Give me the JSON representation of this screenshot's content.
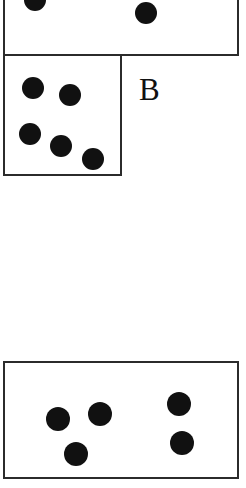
{
  "figure": {
    "kind": "dice-faces-diagram",
    "background_color": "#ffffff",
    "ink_color": "#111111",
    "border_color": "#2b2b2b",
    "labels": [
      {
        "name": "label-b",
        "text": "B",
        "x": 139,
        "y": 74,
        "font_size": 31
      }
    ],
    "groups": [
      {
        "name": "upper-pair-row",
        "x": 3,
        "y": 0,
        "width": 236,
        "height": 56,
        "cells": [
          {
            "name": "cell-upper-left",
            "pip_count": 1,
            "cropped_top": true,
            "x": 0,
            "y": 0,
            "width": 119,
            "height": 56,
            "pips": [
              {
                "cx": 30,
                "cy": 0,
                "r": 11,
                "clipped": true
              }
            ]
          },
          {
            "name": "cell-upper-right",
            "pip_count": 1,
            "cropped_top": true,
            "x": 117,
            "y": 0,
            "width": 119,
            "height": 56,
            "pips": [
              {
                "cx": 26,
                "cy": 13,
                "r": 11,
                "clipped": false
              }
            ]
          }
        ]
      },
      {
        "name": "five-face-row",
        "x": 3,
        "y": 54,
        "width": 119,
        "height": 122,
        "cells": [
          {
            "name": "cell-five",
            "pip_count": 5,
            "cropped_top": false,
            "x": 0,
            "y": 0,
            "width": 119,
            "height": 122,
            "pips": [
              {
                "cx": 28,
                "cy": 32,
                "r": 11,
                "clipped": false
              },
              {
                "cx": 65,
                "cy": 39,
                "r": 11,
                "clipped": false
              },
              {
                "cx": 25,
                "cy": 78,
                "r": 11,
                "clipped": false
              },
              {
                "cx": 56,
                "cy": 90,
                "r": 11,
                "clipped": false
              },
              {
                "cx": 88,
                "cy": 103,
                "r": 11,
                "clipped": false
              }
            ]
          }
        ]
      },
      {
        "name": "lower-pair-row",
        "x": 3,
        "y": 361,
        "width": 236,
        "height": 118,
        "cells": [
          {
            "name": "cell-lower-left",
            "pip_count": 3,
            "cropped_top": false,
            "x": 0,
            "y": 0,
            "width": 119,
            "height": 118,
            "pips": [
              {
                "cx": 53,
                "cy": 56,
                "r": 12,
                "clipped": false
              },
              {
                "cx": 95,
                "cy": 51,
                "r": 12,
                "clipped": false
              },
              {
                "cx": 71,
                "cy": 91,
                "r": 12,
                "clipped": false
              }
            ]
          },
          {
            "name": "cell-lower-right",
            "pip_count": 2,
            "cropped_top": false,
            "x": 117,
            "y": 0,
            "width": 119,
            "height": 118,
            "pips": [
              {
                "cx": 59,
                "cy": 41,
                "r": 12,
                "clipped": false
              },
              {
                "cx": 62,
                "cy": 80,
                "r": 12,
                "clipped": false
              }
            ]
          }
        ]
      }
    ]
  }
}
